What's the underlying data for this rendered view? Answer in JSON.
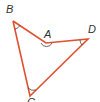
{
  "diagram": {
    "type": "geometry-figure",
    "shape": "concave quadrilateral",
    "line_color": "#e0502e",
    "arc_color": "#444444",
    "vertices": [
      {
        "label": "B",
        "x": 13,
        "y": 21,
        "label_x": 6,
        "label_y": 13
      },
      {
        "label": "A",
        "x": 46,
        "y": 43,
        "label_x": 44,
        "label_y": 38
      },
      {
        "label": "D",
        "x": 88,
        "y": 39,
        "label_x": 88,
        "label_y": 33
      },
      {
        "label": "C",
        "x": 30,
        "y": 96,
        "label_x": 27,
        "label_y": 106
      }
    ],
    "edges": [
      [
        "B",
        "A"
      ],
      [
        "A",
        "D"
      ],
      [
        "D",
        "C"
      ],
      [
        "C",
        "B"
      ]
    ],
    "angle_marks": [
      "B",
      "A",
      "D",
      "C"
    ]
  }
}
